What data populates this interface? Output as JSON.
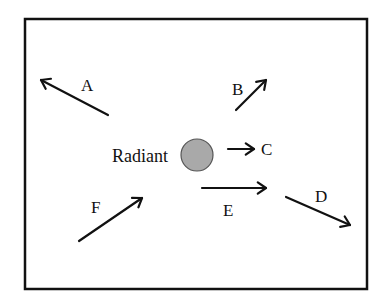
{
  "diagram": {
    "frame": {
      "x": 25,
      "y": 19,
      "width": 342,
      "height": 270,
      "stroke": "#111111"
    },
    "radiant": {
      "label": "Radiant",
      "circle": {
        "cx": 197,
        "cy": 155,
        "r": 16,
        "fill": "#a9a9a9",
        "stroke": "#555555"
      },
      "label_pos": {
        "x": 112,
        "y": 162
      }
    },
    "arrows": [
      {
        "id": "A",
        "label": "A",
        "x1": 108,
        "y1": 115,
        "x2": 41,
        "y2": 80,
        "label_x": 81,
        "label_y": 91
      },
      {
        "id": "B",
        "label": "B",
        "x1": 236,
        "y1": 110,
        "x2": 266,
        "y2": 80,
        "label_x": 232,
        "label_y": 95
      },
      {
        "id": "C",
        "label": "C",
        "x1": 228,
        "y1": 149,
        "x2": 254,
        "y2": 149,
        "label_x": 261,
        "label_y": 155
      },
      {
        "id": "D",
        "label": "D",
        "x1": 286,
        "y1": 197,
        "x2": 350,
        "y2": 225,
        "label_x": 315,
        "label_y": 202
      },
      {
        "id": "E",
        "label": "E",
        "x1": 202,
        "y1": 188,
        "x2": 266,
        "y2": 188,
        "label_x": 223,
        "label_y": 216
      },
      {
        "id": "F",
        "label": "F",
        "x1": 79,
        "y1": 241,
        "x2": 142,
        "y2": 198,
        "label_x": 91,
        "label_y": 213
      }
    ]
  }
}
